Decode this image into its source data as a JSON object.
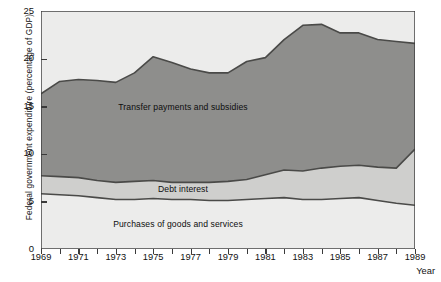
{
  "chart_data": {
    "type": "area",
    "title": "",
    "xlabel": "Year",
    "ylabel": "Federal government expenditure (percentage of GDP)",
    "xlim": [
      1969,
      1989
    ],
    "ylim": [
      0,
      25
    ],
    "yticks": [
      0,
      5,
      10,
      15,
      20,
      25
    ],
    "xticks": [
      1969,
      1971,
      1973,
      1975,
      1977,
      1979,
      1981,
      1983,
      1985,
      1987,
      1989
    ],
    "xticks_minor": [
      1970,
      1972,
      1974,
      1976,
      1978,
      1980,
      1982,
      1984,
      1986,
      1988
    ],
    "grid": false,
    "legend_position": "inline-band-labels",
    "stacked": true,
    "x": [
      1969,
      1970,
      1971,
      1972,
      1973,
      1974,
      1975,
      1976,
      1977,
      1978,
      1979,
      1980,
      1981,
      1982,
      1983,
      1984,
      1985,
      1986,
      1987,
      1988,
      1989
    ],
    "series": [
      {
        "name": "Purchases of goods and services",
        "color": "#ececeb",
        "values": [
          5.8,
          5.7,
          5.6,
          5.4,
          5.2,
          5.2,
          5.3,
          5.2,
          5.2,
          5.1,
          5.1,
          5.2,
          5.3,
          5.4,
          5.2,
          5.2,
          5.3,
          5.4,
          5.1,
          4.8,
          4.6
        ]
      },
      {
        "name": "Debt interest",
        "color": "#cfcfcd",
        "values": [
          1.9,
          1.9,
          1.9,
          1.8,
          1.8,
          1.9,
          1.9,
          1.8,
          1.8,
          1.9,
          2.0,
          2.1,
          2.5,
          2.9,
          3.0,
          3.3,
          3.4,
          3.4,
          3.5,
          3.7,
          5.9
        ]
      },
      {
        "name": "Transfer payments and subsidies",
        "color": "#8e8e8c",
        "values": [
          8.6,
          10.0,
          10.3,
          10.5,
          10.5,
          11.4,
          13.0,
          12.6,
          11.9,
          11.5,
          11.4,
          12.4,
          12.3,
          13.7,
          15.3,
          15.1,
          14.0,
          13.9,
          13.4,
          13.3,
          11.1
        ]
      }
    ],
    "cumulative_top": [
      16.3,
      17.6,
      17.8,
      17.7,
      17.5,
      18.5,
      20.2,
      19.6,
      18.9,
      18.5,
      18.5,
      19.7,
      20.1,
      22.0,
      23.5,
      23.6,
      22.7,
      22.7,
      22.0,
      21.8,
      21.6
    ],
    "cumulative_mid": [
      7.7,
      7.6,
      7.5,
      7.2,
      7.0,
      7.1,
      7.2,
      7.0,
      7.0,
      7.0,
      7.1,
      7.3,
      7.8,
      8.3,
      8.2,
      8.5,
      8.7,
      8.8,
      8.6,
      8.5,
      10.5
    ],
    "cumulative_bottom": [
      5.8,
      5.7,
      5.6,
      5.4,
      5.2,
      5.2,
      5.3,
      5.2,
      5.2,
      5.1,
      5.1,
      5.2,
      5.3,
      5.4,
      5.2,
      5.2,
      5.3,
      5.4,
      5.1,
      4.8,
      4.6
    ],
    "band_labels": [
      {
        "text": "Transfer payments and subsidies",
        "x_px": 183,
        "y_px": 102
      },
      {
        "text": "Debt interest",
        "x_px": 183,
        "y_px": 184
      },
      {
        "text": "Purchases of goods and services",
        "x_px": 178,
        "y_px": 219
      }
    ]
  },
  "colors": {
    "transfer": "#8e8e8c",
    "debt_interest": "#cfcfcd",
    "purchases": "#ececeb",
    "background": "#ececeb",
    "line": "#4a4a48",
    "axis": "#3a3a3a",
    "text": "#111111"
  }
}
